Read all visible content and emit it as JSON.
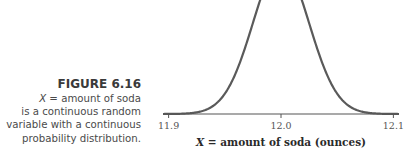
{
  "caption": {
    "figure_label": "FIGURE 6.16",
    "variable": "X",
    "line1_rest": " = amount of soda",
    "line2": "is a continuous random",
    "line3": "variable with a continuous",
    "line4": "probability distribution."
  },
  "chart_data": {
    "type": "line",
    "title": "",
    "distribution": {
      "family": "normal",
      "mean": 12.0,
      "sd": 0.025
    },
    "xlabel_var": "X",
    "xlabel_rest": " = amount of soda (ounces)",
    "ylabel": "",
    "xlim": [
      11.895,
      12.105
    ],
    "x_ticks": [
      11.9,
      12.0,
      12.1
    ],
    "x_tick_labels": [
      "11.9",
      "12.0",
      "12.1"
    ],
    "grid": false,
    "legend": "none",
    "colors": {
      "curve": "#5a5a5a",
      "axis": "#555555"
    }
  }
}
